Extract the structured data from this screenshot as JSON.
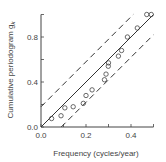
{
  "chart_data": {
    "type": "scatter",
    "title": "",
    "xlabel": "Frequency (cycles/year)",
    "ylabel": "Cumulative periodogram g",
    "ylabel_subscript": "k",
    "xlim": [
      0.0,
      0.5
    ],
    "ylim": [
      0.0,
      1.0
    ],
    "xticks": [
      0.0,
      0.1,
      0.2,
      0.3,
      0.4,
      0.5
    ],
    "xtick_labels": [
      "0.0",
      "0.2",
      "0.4"
    ],
    "xtick_label_values": [
      0.0,
      0.2,
      0.4
    ],
    "yticks": [
      0.0,
      0.2,
      0.4,
      0.6,
      0.8,
      1.0
    ],
    "ytick_labels": [
      "0.0",
      "0.4",
      "0.8"
    ],
    "ytick_label_values": [
      0.0,
      0.4,
      0.8
    ],
    "grid": false,
    "series": [
      {
        "name": "Cumulative periodogram",
        "marker": "circle-open",
        "points": [
          [
            0.047,
            0.075
          ],
          [
            0.089,
            0.1
          ],
          [
            0.106,
            0.17
          ],
          [
            0.143,
            0.18
          ],
          [
            0.188,
            0.21
          ],
          [
            0.2,
            0.28
          ],
          [
            0.227,
            0.33
          ],
          [
            0.282,
            0.42
          ],
          [
            0.289,
            0.47
          ],
          [
            0.299,
            0.54
          ],
          [
            0.3,
            0.57
          ],
          [
            0.344,
            0.63
          ],
          [
            0.358,
            0.68
          ],
          [
            0.384,
            0.8
          ],
          [
            0.428,
            0.88
          ],
          [
            0.47,
            1.0
          ],
          [
            0.49,
            1.0
          ]
        ]
      },
      {
        "name": "Theoretical (white noise)",
        "style": "solid",
        "line": [
          [
            0.0,
            0.0
          ],
          [
            0.5,
            1.0
          ]
        ]
      },
      {
        "name": "Upper confidence limit",
        "style": "dashed",
        "line": [
          [
            0.0,
            0.18
          ],
          [
            0.41,
            1.0
          ]
        ]
      },
      {
        "name": "Lower confidence limit",
        "style": "dashed",
        "line": [
          [
            0.09,
            0.0
          ],
          [
            0.5,
            0.82
          ]
        ]
      }
    ]
  }
}
